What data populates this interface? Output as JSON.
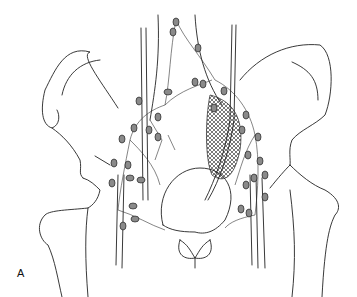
{
  "figure": {
    "panel_label": "A",
    "colors": {
      "line": "#222222",
      "node_fill": "#8a8a8a",
      "background": "#ffffff"
    }
  }
}
